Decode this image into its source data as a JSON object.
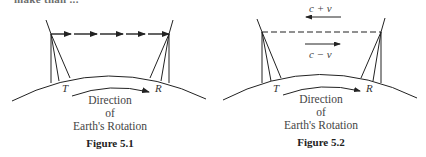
{
  "top_cutoff_text": "make than ...",
  "figures": [
    {
      "id": "fig-5-1",
      "caption": "Figure 5.1",
      "transmitter_label": "T",
      "receiver_label": "R",
      "direction_lines": [
        "Direction",
        "of",
        "Earth's Rotation"
      ],
      "signal_style": "solid arrows (T to R)"
    },
    {
      "id": "fig-5-2",
      "caption": "Figure 5.2",
      "transmitter_label": "T",
      "receiver_label": "R",
      "direction_lines": [
        "Direction",
        "of",
        "Earth's Rotation"
      ],
      "signal_style": "dashed line",
      "upper_velocity_label": "c + v",
      "upper_arrow_direction": "left",
      "lower_velocity_label": "c − v",
      "lower_arrow_direction": "right"
    }
  ],
  "colors": {
    "ink": "#222222",
    "background": "#ffffff"
  }
}
